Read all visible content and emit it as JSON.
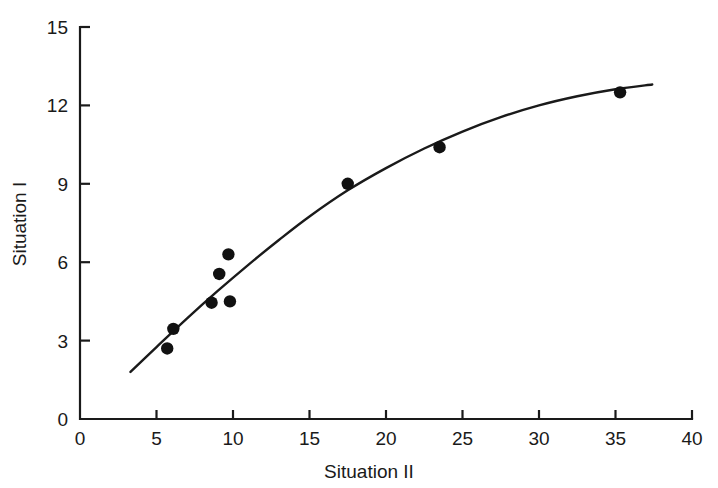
{
  "chart_data": {
    "type": "scatter",
    "title": "",
    "xlabel": "Situation II",
    "ylabel": "Situation I",
    "xlim": [
      0,
      40
    ],
    "ylim": [
      0,
      15
    ],
    "xticks": [
      0,
      5,
      10,
      15,
      20,
      25,
      30,
      35,
      40
    ],
    "xticklabels": [
      "0",
      "5",
      "10",
      "15",
      "20",
      "25",
      "30",
      "35",
      "40"
    ],
    "yticks": [
      0,
      3,
      6,
      9,
      12,
      15
    ],
    "yticklabels": [
      "0",
      "3",
      "6",
      "9",
      "12",
      "15"
    ],
    "grid": false,
    "legend": null,
    "marker": "filled-circle",
    "points": [
      {
        "x": 5.7,
        "y": 2.7
      },
      {
        "x": 6.1,
        "y": 3.45
      },
      {
        "x": 8.6,
        "y": 4.45
      },
      {
        "x": 9.8,
        "y": 4.5
      },
      {
        "x": 9.1,
        "y": 5.55
      },
      {
        "x": 9.7,
        "y": 6.3
      },
      {
        "x": 17.5,
        "y": 9.0
      },
      {
        "x": 23.5,
        "y": 10.4
      },
      {
        "x": 35.3,
        "y": 12.5
      }
    ],
    "series": [
      {
        "name": "fitted-curve",
        "type": "line",
        "points": [
          {
            "x": 3.3,
            "y": 1.8
          },
          {
            "x": 5.0,
            "y": 2.75
          },
          {
            "x": 7.0,
            "y": 3.85
          },
          {
            "x": 9.0,
            "y": 4.9
          },
          {
            "x": 11.0,
            "y": 5.9
          },
          {
            "x": 13.0,
            "y": 6.85
          },
          {
            "x": 15.0,
            "y": 7.75
          },
          {
            "x": 17.5,
            "y": 8.75
          },
          {
            "x": 20.0,
            "y": 9.6
          },
          {
            "x": 22.5,
            "y": 10.35
          },
          {
            "x": 25.0,
            "y": 11.0
          },
          {
            "x": 27.5,
            "y": 11.55
          },
          {
            "x": 30.0,
            "y": 12.0
          },
          {
            "x": 32.5,
            "y": 12.35
          },
          {
            "x": 35.0,
            "y": 12.62
          },
          {
            "x": 37.4,
            "y": 12.8
          }
        ]
      }
    ]
  },
  "axes": {
    "x_title": "Situation II",
    "y_title": "Situation I"
  },
  "colors": {
    "ink": "#1a1a1a",
    "marker": "#111111",
    "background": "#ffffff"
  }
}
